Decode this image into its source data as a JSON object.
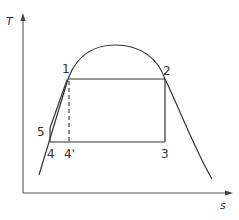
{
  "diagram": {
    "type": "T-s diagram (Rankine-type cycle)",
    "axes": {
      "y_label": "T",
      "x_label": "s"
    },
    "points": [
      {
        "id": "1",
        "label": "1",
        "x": 68,
        "y": 79
      },
      {
        "id": "2",
        "label": "2",
        "x": 165,
        "y": 79
      },
      {
        "id": "3",
        "label": "3",
        "x": 165,
        "y": 142
      },
      {
        "id": "4",
        "label": "4",
        "x": 50,
        "y": 142
      },
      {
        "id": "4p",
        "label": "4'",
        "x": 69,
        "y": 142
      },
      {
        "id": "5",
        "label": "5",
        "x": 50,
        "y": 128
      }
    ],
    "labels": {
      "p1": "1",
      "p2": "2",
      "p3": "3",
      "p4": "4",
      "p4prime": "4'",
      "p5": "5"
    },
    "edges": [
      {
        "from": "1",
        "to": "2",
        "style": "solid"
      },
      {
        "from": "2",
        "to": "3",
        "style": "solid"
      },
      {
        "from": "3",
        "to": "4",
        "style": "solid"
      },
      {
        "from": "4",
        "to": "5",
        "style": "solid"
      },
      {
        "from": "5",
        "to": "1",
        "style": "solid"
      },
      {
        "from": "1",
        "to": "4p",
        "style": "dashed"
      }
    ],
    "saturation_dome": "bell curve peaking near top, liquid line on left, vapor line on right",
    "colors": {
      "line": "#333333",
      "background": "#ffffff"
    }
  }
}
